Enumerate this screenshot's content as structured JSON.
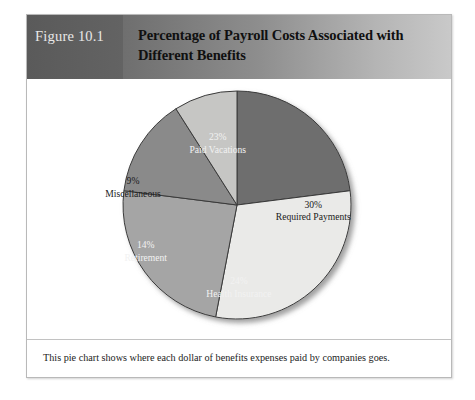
{
  "figure": {
    "number_label": "Figure 10.1",
    "title": "Percentage of Payroll Costs Associated with Different Benefits",
    "caption": "This pie chart shows where each dollar of benefits expenses paid by companies goes."
  },
  "chart_data": {
    "type": "pie",
    "title": "Percentage of Payroll Costs Associated with Different Benefits",
    "unit": "percent",
    "start_angle_deg": 0,
    "direction": "clockwise",
    "legend": "none",
    "labels_inside": true,
    "categories": [
      "Paid Vacations",
      "Required Payments",
      "Health Insurance",
      "Retirement",
      "Miscellaneous"
    ],
    "values": [
      23,
      30,
      24,
      14,
      9
    ],
    "total": 100,
    "slices": [
      {
        "name": "Paid Vacations",
        "value": 23,
        "value_label": "23%",
        "color": "#6e6e6e",
        "text_color": "#f2f2f2",
        "label_x_pct": 45.0,
        "label_y_pct": 25.0
      },
      {
        "name": "Required Payments",
        "value": 30,
        "value_label": "30%",
        "color": "#eaeae8",
        "text_color": "#1b1b1b",
        "label_x_pct": 67.5,
        "label_y_pct": 51.0
      },
      {
        "name": "Health Insurance",
        "value": 24,
        "value_label": "24%",
        "color": "#a5a5a5",
        "text_color": "#f2f2f2",
        "label_x_pct": 50.0,
        "label_y_pct": 80.5
      },
      {
        "name": "Retirement",
        "value": 14,
        "value_label": "14%",
        "color": "#8a8a8a",
        "text_color": "#f2f2f2",
        "label_x_pct": 28.0,
        "label_y_pct": 66.5
      },
      {
        "name": "Miscellaneous",
        "value": 9,
        "value_label": "9%",
        "color": "#c6c6c4",
        "text_color": "#1b1b1b",
        "label_x_pct": 25.0,
        "label_y_pct": 42.0
      }
    ]
  },
  "colors": {
    "header_dark": "#5d5d5d",
    "header_light": "#c9c9c9",
    "frame_border": "#b9b9b9",
    "slice_outline": "#3a3a3a",
    "page_background": "#ffffff"
  }
}
